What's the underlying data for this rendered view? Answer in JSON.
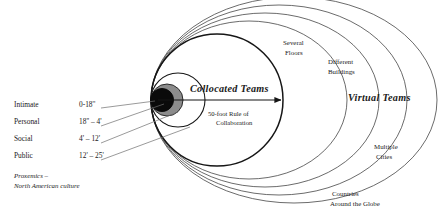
{
  "figure": {
    "type": "concentric-proxemics-diagram",
    "background": "#ffffff",
    "stroke_color": "#1d1d1d",
    "fill_intimate": "#0a0a0a",
    "fill_personal": "#8c8c8c"
  },
  "proxemic_zones": [
    {
      "name": "Intimate",
      "distance": "0-18''"
    },
    {
      "name": "Personal",
      "distance": "18'' – 4'"
    },
    {
      "name": "Social",
      "distance": "4' – 12'"
    },
    {
      "name": "Public",
      "distance": "12' – 25'"
    }
  ],
  "source_note": {
    "line1": "Proxemics –",
    "line2": "North American culture"
  },
  "collocated": {
    "title": "Collocated Teams",
    "rule_line1": "50-foot Rule of",
    "rule_line2": "Collaboration"
  },
  "virtual": {
    "title": "Virtual Teams",
    "rings": [
      {
        "line1": "Several",
        "line2": "Floors"
      },
      {
        "line1": "Different",
        "line2": "Buildings"
      },
      {
        "line1": "Multiple",
        "line2": "Cities"
      },
      {
        "line1": "Countries",
        "line2": "Around the Globe"
      }
    ]
  }
}
